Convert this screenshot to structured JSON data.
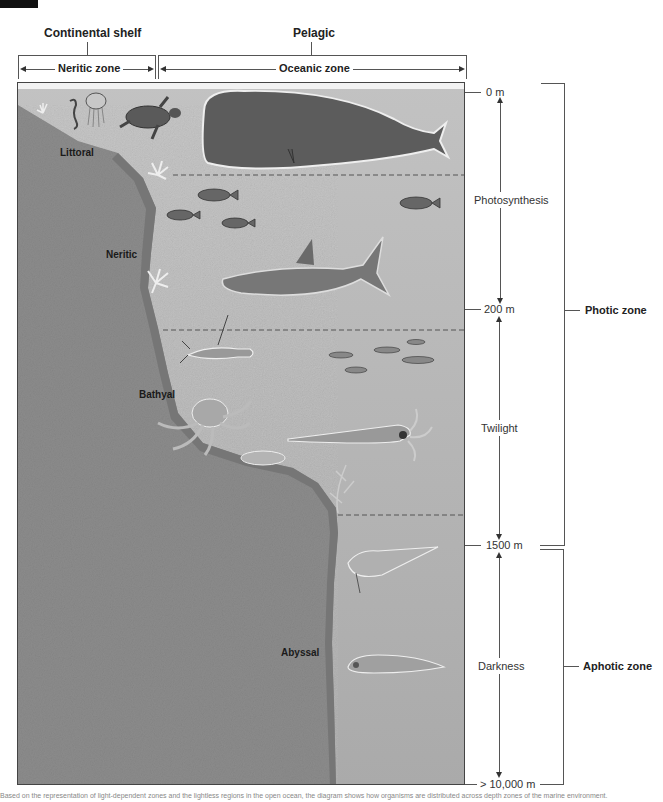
{
  "header": {
    "continental_shelf": "Continental shelf",
    "pelagic": "Pelagic",
    "neritic_zone": "Neritic zone",
    "oceanic_zone": "Oceanic zone"
  },
  "regions": {
    "littoral": "Littoral",
    "neritic": "Neritic",
    "bathyal": "Bathyal",
    "abyssal": "Abyssal"
  },
  "depth_scale": {
    "marks": [
      "0 m",
      "200 m",
      "1500 m",
      "> 10,000 m"
    ],
    "light_levels": [
      "Photosynthesis",
      "Twilight",
      "Darkness"
    ]
  },
  "side_zones": {
    "photic": "Photic zone",
    "aphotic": "Aphotic zone"
  },
  "organisms": [
    "coral",
    "seahorse",
    "jellyfish",
    "sea-turtle",
    "sperm-whale",
    "reef-fish",
    "shark",
    "lobster",
    "small-fish-school",
    "octopus",
    "squid",
    "sea-fan",
    "anglerfish",
    "deep-sea-fish"
  ],
  "colors": {
    "water": "#b9b9b9",
    "seafloor": "#8a8a8a",
    "seafloor_edge": "#6f6f6f",
    "line": "#555555",
    "text": "#222222"
  },
  "caption": "Based on the representation of light-dependent zones and the lightless regions in the open ocean, the diagram shows how organisms are distributed across depth zones of the marine environment."
}
